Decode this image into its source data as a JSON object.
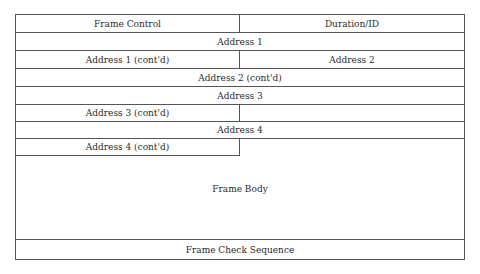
{
  "diagram": {
    "fields": [
      {
        "id": "frame_control",
        "label": "Frame Control"
      },
      {
        "id": "duration_id",
        "label": "Duration/ID"
      },
      {
        "id": "address1",
        "label": "Address 1"
      },
      {
        "id": "address1_cont",
        "label": "Address 1 (cont'd)"
      },
      {
        "id": "address2",
        "label": "Address 2"
      },
      {
        "id": "address2_cont",
        "label": "Address 2 (cont'd)"
      },
      {
        "id": "address3",
        "label": "Address 3"
      },
      {
        "id": "address3_cont",
        "label": "Address 3 (cont'd)"
      },
      {
        "id": "seq_control_blank",
        "label": ""
      },
      {
        "id": "address4",
        "label": "Address 4"
      },
      {
        "id": "address4_cont",
        "label": "Address 4 (cont'd)"
      },
      {
        "id": "frame_body",
        "label": "Frame Body"
      },
      {
        "id": "fcs",
        "label": "Frame Check Sequence"
      }
    ]
  }
}
